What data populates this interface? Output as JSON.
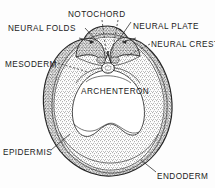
{
  "figure": {
    "background_color": "#fdfdfd",
    "ink_color": "#1b1b1b",
    "style": "stippled pen-and-ink scientific illustration"
  },
  "labels": {
    "notochord": "NOTOCHORD",
    "neural_folds": "NEURAL FOLDS",
    "neural_plate": "NEURAL PLATE",
    "neural_crest": "NEURAL CREST",
    "mesoderm": "MESODERM",
    "archenteron": "ARCHENTERON",
    "epidermis": "EPIDERMIS",
    "endoderm": "ENDODERM"
  },
  "structures": [
    {
      "name": "notochord",
      "label": "NOTOCHORD",
      "position": "dorsal midline, beneath neural groove"
    },
    {
      "name": "neural-folds",
      "label": "NEURAL FOLDS",
      "position": "paired dorsal ridges"
    },
    {
      "name": "neural-plate",
      "label": "NEURAL PLATE",
      "position": "dorsal midline ectoderm"
    },
    {
      "name": "neural-crest",
      "label": "NEURAL CREST",
      "position": "lateral margin of neural fold"
    },
    {
      "name": "mesoderm",
      "label": "MESODERM",
      "position": "middle germ layer, lateral"
    },
    {
      "name": "archenteron",
      "label": "ARCHENTERON",
      "position": "central cavity"
    },
    {
      "name": "epidermis",
      "label": "EPIDERMIS",
      "position": "outer surface layer"
    },
    {
      "name": "endoderm",
      "label": "ENDODERM",
      "position": "inner germ layer, ventral"
    }
  ]
}
